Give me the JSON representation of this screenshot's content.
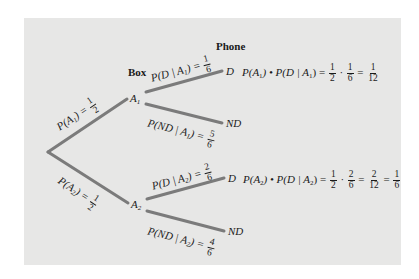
{
  "headers": {
    "box": "Box",
    "phone": "Phone"
  },
  "nodes": {
    "a1": "A",
    "a1_sub": "1",
    "a2": "A",
    "a2_sub": "2",
    "d1": "D",
    "nd1": "ND",
    "d2": "D",
    "nd2": "ND"
  },
  "branches": {
    "root_a1": {
      "prefix": "P(A",
      "sub": "1",
      "suffix": ") = ",
      "num": "1",
      "den": "2"
    },
    "root_a2": {
      "prefix": "P(A",
      "sub": "2",
      "suffix": ") = ",
      "num": "1",
      "den": "2"
    },
    "a1_d": {
      "prefix": "P(D | A",
      "sub": "1",
      "suffix": ") = ",
      "num": "1",
      "den": "6"
    },
    "a1_nd": {
      "prefix": "P(ND | A",
      "sub": "1",
      "suffix": ") = ",
      "num": "5",
      "den": "6"
    },
    "a2_d": {
      "prefix": "P(D | A",
      "sub": "2",
      "suffix": ") = ",
      "num": "2",
      "den": "6"
    },
    "a2_nd": {
      "prefix": "P(ND | A",
      "sub": "2",
      "suffix": ") = ",
      "num": "4",
      "den": "6"
    }
  },
  "products": {
    "a1_d": {
      "lhs_a": "P(A",
      "lhs_a_sub": "1",
      "lhs_mid": ") • P(D | A",
      "lhs_b_sub": "1",
      "lhs_end": ") = ",
      "f1_num": "1",
      "f1_den": "2",
      "dot": " · ",
      "f2_num": "1",
      "f2_den": "6",
      "eq": " = ",
      "f3_num": "1",
      "f3_den": "12"
    },
    "a2_d": {
      "lhs_a": "P(A",
      "lhs_a_sub": "2",
      "lhs_mid": ") • P(D | A",
      "lhs_b_sub": "2",
      "lhs_end": ") = ",
      "f1_num": "1",
      "f1_den": "2",
      "dot": " · ",
      "f2_num": "2",
      "f2_den": "6",
      "eq": " = ",
      "f3_num": "2",
      "f3_den": "12",
      "eq2": " = ",
      "f4_num": "1",
      "f4_den": "6"
    }
  },
  "colors": {
    "panel": "#e7e7e6",
    "branch": "#7b7b7b",
    "text": "#1a1a1a"
  }
}
